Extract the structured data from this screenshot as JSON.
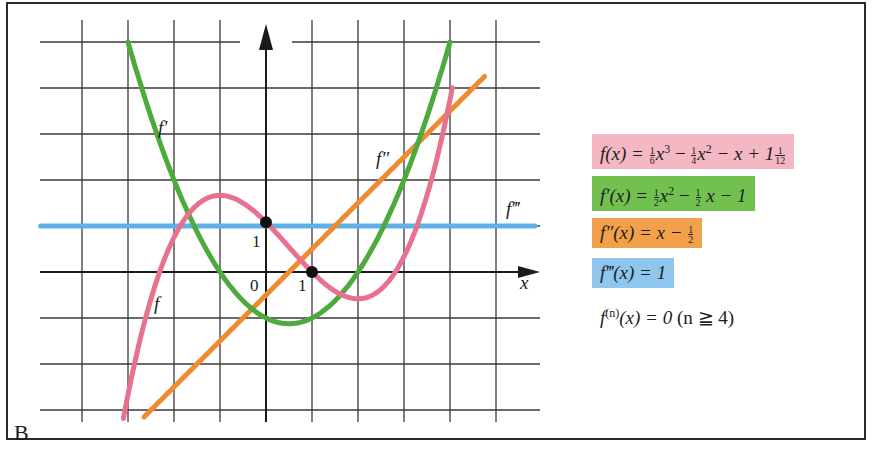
{
  "panel": {
    "label": "B"
  },
  "axes": {
    "x_label": "x",
    "origin_label": "0",
    "x_tick_label": "1",
    "y_tick_label": "1"
  },
  "curve_labels": {
    "f": "f",
    "f1": "f′",
    "f2": "f″",
    "f3": "f‴"
  },
  "equations": [
    {
      "id": "f",
      "text": "f(x) = 1/6 x^3 − 1/4 x^2 − x + 1 1/12",
      "color": "#f4b8c4"
    },
    {
      "id": "f1",
      "text": "f′(x) = 1/2 x^2 − 1/2 x − 1",
      "color": "#72c150"
    },
    {
      "id": "f2",
      "text": "f″(x) = x − 1/2",
      "color": "#f2a04a"
    },
    {
      "id": "f3",
      "text": "f‴(x) = 1",
      "color": "#8ec6ee"
    },
    {
      "id": "fn",
      "text": "f⁽ⁿ⁾(x) = 0 (n ≧ 4)",
      "color": ""
    }
  ],
  "eq_parts": {
    "f_lhs": "f(x) =",
    "f_a_n": "1",
    "f_a_d": "6",
    "f_x3": "x",
    "f_p3": "3",
    "f_minus1": "−",
    "f_b_n": "1",
    "f_b_d": "4",
    "f_x2": "x",
    "f_p2": "2",
    "f_rest": "− x + 1",
    "f_c_n": "1",
    "f_c_d": "12",
    "f1_lhs": "f′(x) =",
    "f1_a_n": "1",
    "f1_a_d": "2",
    "f1_x2": "x",
    "f1_p2": "2",
    "f1_minus": "−",
    "f1_b_n": "1",
    "f1_b_d": "2",
    "f1_rest": "x − 1",
    "f2_lhs": "f″(x) = x −",
    "f2_a_n": "1",
    "f2_a_d": "2",
    "f3_lhs": "f‴(x) = 1",
    "fn_lhs": "f",
    "fn_sup": "(n)",
    "fn_rest": "(x) = 0",
    "fn_cond": "(n ≧ 4)"
  },
  "chart_data": {
    "type": "line",
    "title": "",
    "xlabel": "x",
    "ylabel": "",
    "xlim": [
      -5.3,
      5.8
    ],
    "ylim": [
      -3.1,
      5.5
    ],
    "grid": true,
    "grid_step": 1,
    "series": [
      {
        "name": "f",
        "formula": "x^3/6 - x^2/4 - x + 13/12",
        "color": "#e8718f",
        "x_range": [
          -3.1,
          4.2
        ],
        "points": [
          [
            -3,
            -4.17
          ],
          [
            -2,
            0.08
          ],
          [
            -1,
            1.67
          ],
          [
            0,
            1.08
          ],
          [
            1,
            0
          ],
          [
            2,
            -0.25
          ],
          [
            3,
            1.83
          ],
          [
            4,
            5.75
          ]
        ]
      },
      {
        "name": "f′",
        "formula": "x^2/2 - x/2 - 1",
        "color": "#4daa3c",
        "x_range": [
          -3.0,
          3.9
        ],
        "points": [
          [
            -3,
            5
          ],
          [
            -2,
            2
          ],
          [
            -1,
            0
          ],
          [
            0,
            -1
          ],
          [
            0.5,
            -1.125
          ],
          [
            1,
            -1
          ],
          [
            2,
            0
          ],
          [
            3,
            2
          ],
          [
            3.9,
            4.66
          ]
        ]
      },
      {
        "name": "f″",
        "formula": "x - 1/2",
        "color": "#f08a2c",
        "x_range": [
          -2.6,
          4.8
        ],
        "points": [
          [
            -2.6,
            -3.1
          ],
          [
            0,
            -0.5
          ],
          [
            0.5,
            0
          ],
          [
            4.8,
            4.3
          ]
        ]
      },
      {
        "name": "f‴",
        "formula": "1",
        "color": "#5fb0e6",
        "x_range": [
          -5.3,
          5.8
        ],
        "points": [
          [
            -5.3,
            1
          ],
          [
            5.8,
            1
          ]
        ]
      }
    ],
    "marked_points": [
      [
        0,
        1.0833
      ],
      [
        1,
        0
      ]
    ],
    "annotations": [
      "f",
      "f′",
      "f″",
      "f‴",
      "0",
      "1",
      "1",
      "x",
      "B"
    ]
  }
}
